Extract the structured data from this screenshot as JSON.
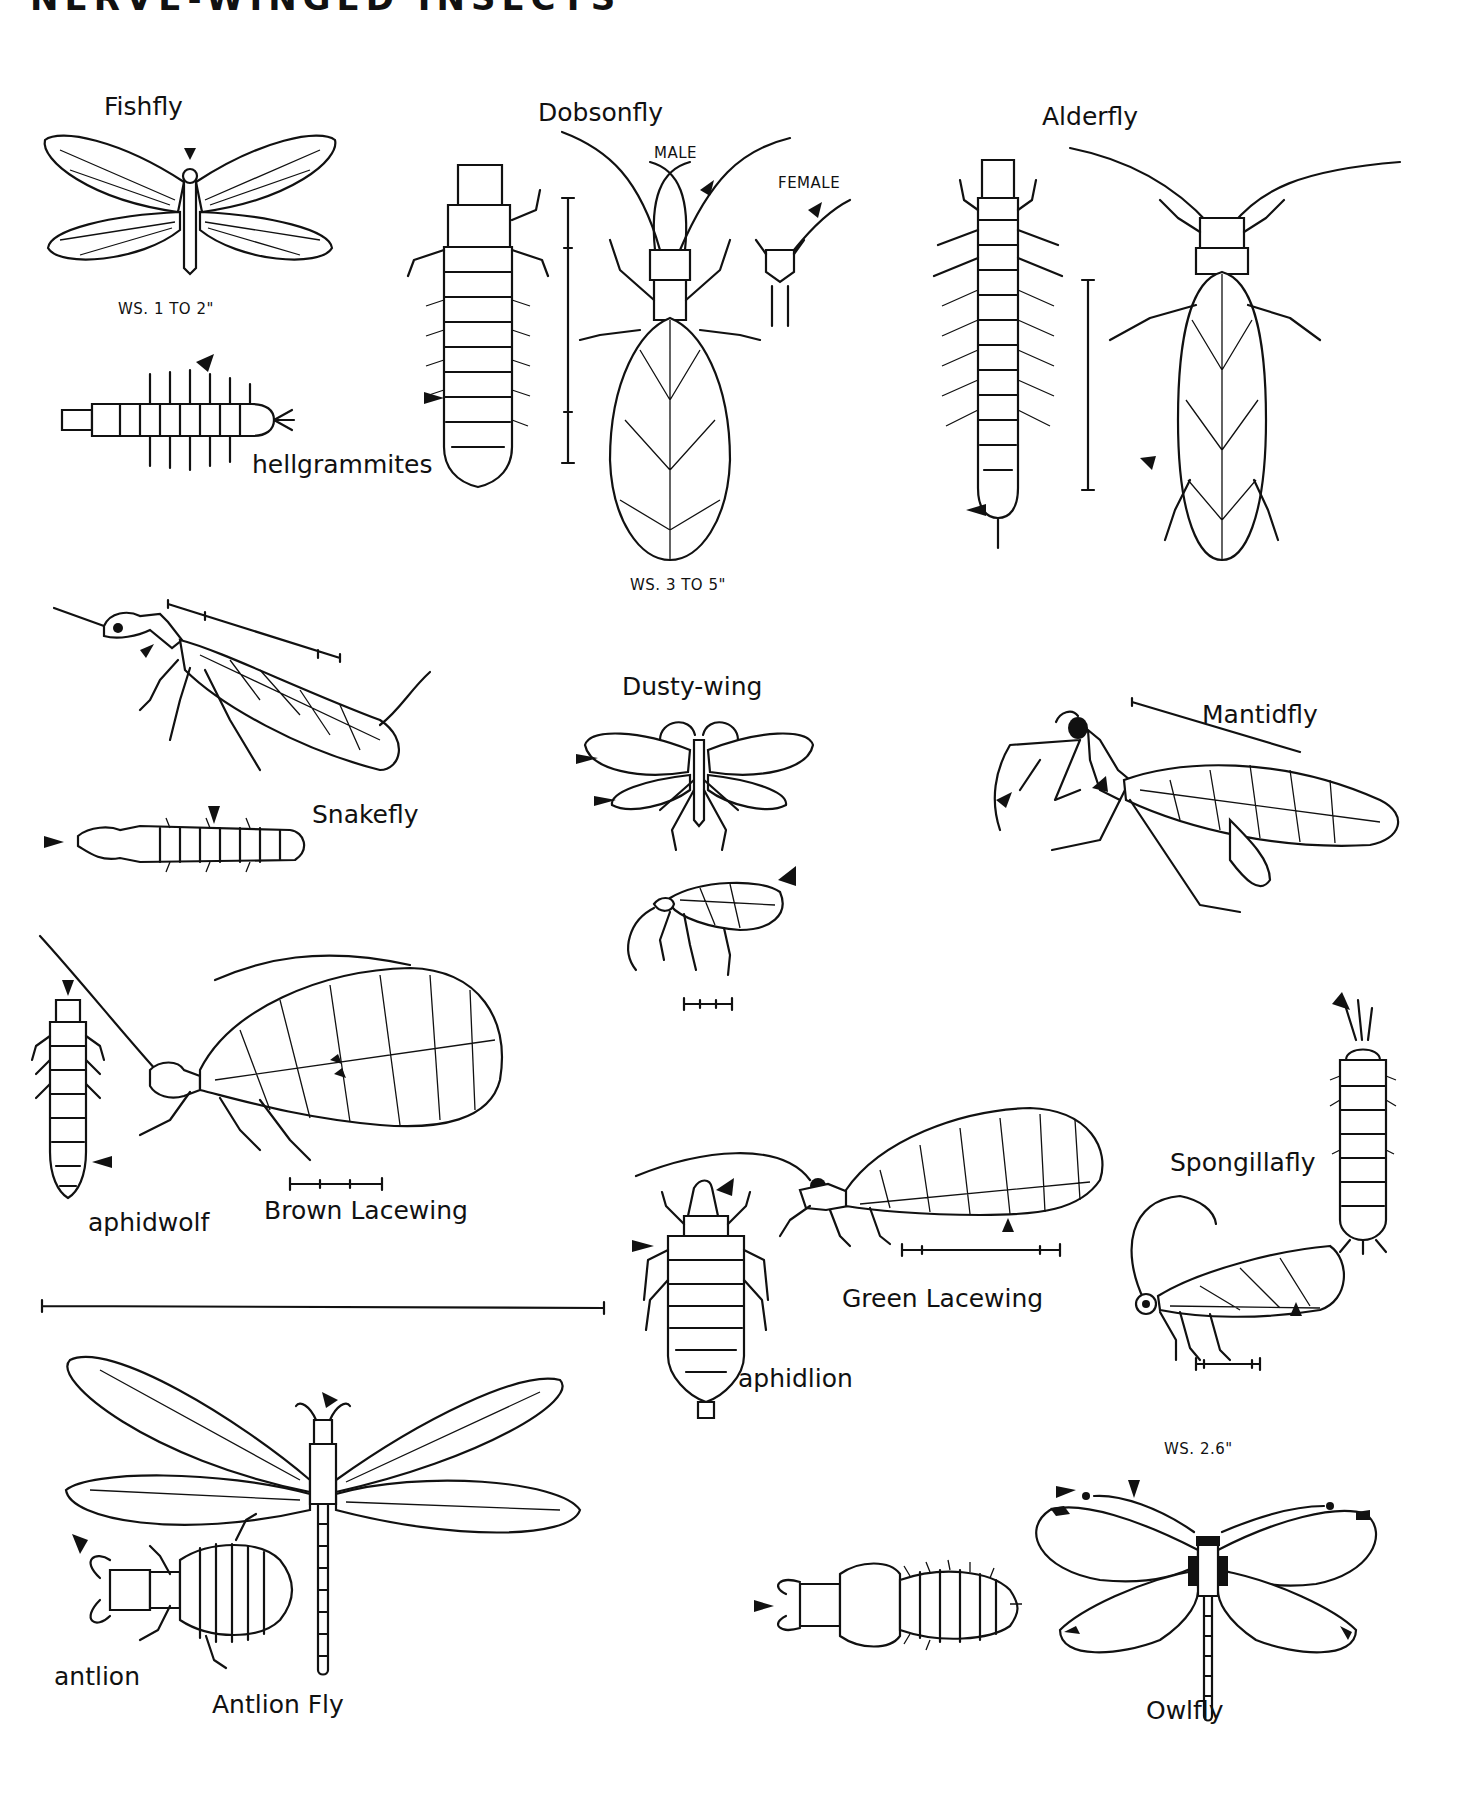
{
  "page": {
    "title": "NERVE-WINGED INSECTS",
    "background": "#ffffff",
    "ink": "#111111"
  },
  "labels": {
    "fishfly": "Fishfly",
    "fishfly_ws": "WS. 1 TO 2\"",
    "hellgrammites": "hellgrammites",
    "dobsonfly": "Dobsonfly",
    "dobsonfly_male": "MALE",
    "dobsonfly_female": "FEMALE",
    "dobsonfly_ws": "WS. 3 TO 5\"",
    "alderfly": "Alderfly",
    "snakefly": "Snakefly",
    "dusty_wing": "Dusty-wing",
    "mantidfly": "Mantidfly",
    "aphidwolf": "aphidwolf",
    "brown_lacewing": "Brown Lacewing",
    "spongillafly": "Spongillafly",
    "green_lacewing": "Green Lacewing",
    "aphidlion": "aphidlion",
    "antlion": "antlion",
    "antlion_fly": "Antlion Fly",
    "owlfly": "Owlfly",
    "owlfly_ws": "WS. 2.6\""
  },
  "figures": [
    {
      "name": "Fishfly",
      "type": "adult",
      "view": "dorsal, wings spread"
    },
    {
      "name": "hellgrammites",
      "type": "larva"
    },
    {
      "name": "Dobsonfly",
      "type": "larva and adult male",
      "inset": "female head"
    },
    {
      "name": "Alderfly",
      "type": "larva and adult"
    },
    {
      "name": "Snakefly",
      "type": "adult and larva"
    },
    {
      "name": "Dusty-wing",
      "type": "adult dorsal and lateral"
    },
    {
      "name": "Mantidfly",
      "type": "adult lateral"
    },
    {
      "name": "Brown Lacewing",
      "type": "adult lateral",
      "larva": "aphidwolf"
    },
    {
      "name": "Spongillafly",
      "type": "larva and adult"
    },
    {
      "name": "Green Lacewing",
      "type": "adult lateral",
      "larva": "aphidlion"
    },
    {
      "name": "Antlion Fly",
      "type": "adult dorsal",
      "larva": "antlion"
    },
    {
      "name": "Owlfly",
      "type": "adult dorsal and larva"
    }
  ]
}
